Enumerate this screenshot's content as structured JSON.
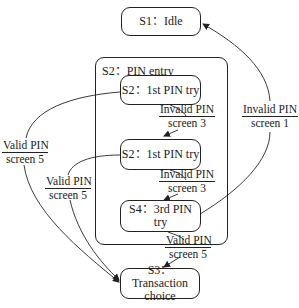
{
  "diagram": {
    "type": "state-machine",
    "states": [
      {
        "id": "s1",
        "label": "S1：Idle"
      },
      {
        "id": "s2",
        "label": "S2：PIN entry",
        "composite": true
      },
      {
        "id": "s2a",
        "label": "S2：1st PIN try",
        "parent": "s2"
      },
      {
        "id": "s2b",
        "label": "S2：1st PIN try",
        "parent": "s2"
      },
      {
        "id": "s4",
        "label": "S4：3rd PIN try",
        "parent": "s2"
      },
      {
        "id": "s3",
        "label": "S3：Transaction choice",
        "line1": "S3：Transaction",
        "line2": "choice"
      }
    ],
    "transitions": [
      {
        "from": "s2a",
        "to": "s2b",
        "event": "Invalid PIN",
        "action": "screen 3"
      },
      {
        "from": "s2b",
        "to": "s4",
        "event": "Invalid PIN",
        "action": "screen 3"
      },
      {
        "from": "s4",
        "to": "s1",
        "event": "Invalid PIN",
        "action": "screen 1"
      },
      {
        "from": "s2a",
        "to": "s3",
        "event": "Valid PIN",
        "action": "screen 5"
      },
      {
        "from": "s2b",
        "to": "s3",
        "event": "Valid PIN",
        "action": "screen 5"
      },
      {
        "from": "s4",
        "to": "s3",
        "event": "Valid PIN",
        "action": "screen 5"
      }
    ]
  }
}
